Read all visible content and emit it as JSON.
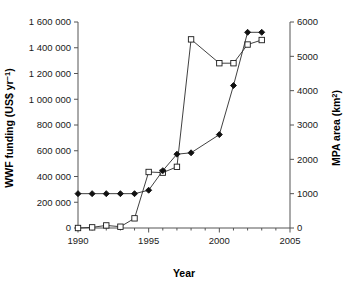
{
  "chart_data": {
    "type": "line",
    "title": "",
    "xlabel": "Year",
    "ylabel": "WWF funding (US$ yr−1)",
    "y2label": "MPA area (km2)",
    "xlim": [
      1990,
      2005
    ],
    "ylim": [
      0,
      1600000
    ],
    "y2lim": [
      0,
      6000
    ],
    "grid": false,
    "legend": "none",
    "x_ticks": [
      "1990",
      "1995",
      "2000",
      "2005"
    ],
    "x_tick_values": [
      1990,
      1995,
      2000,
      2005
    ],
    "x_minor_tick_values": [
      1991,
      1992,
      1993,
      1994,
      1996,
      1997,
      1998,
      1999,
      2001,
      2002,
      2003,
      2004
    ],
    "y_ticks": [
      "0",
      "200 000",
      "400 000",
      "600 000",
      "800 000",
      "1 000 000",
      "1 200 000",
      "1 400 000",
      "1 600 000"
    ],
    "y_tick_values": [
      0,
      200000,
      400000,
      600000,
      800000,
      1000000,
      1200000,
      1400000,
      1600000
    ],
    "y2_ticks": [
      "0",
      "1000",
      "2000",
      "3000",
      "4000",
      "5000",
      "6000"
    ],
    "y2_tick_values": [
      0,
      1000,
      2000,
      3000,
      4000,
      5000,
      6000
    ],
    "series": [
      {
        "name": "WWF funding",
        "axis": "left",
        "marker": "open-square",
        "x": [
          1990,
          1991,
          1992,
          1993,
          1994,
          1995,
          1996,
          1997,
          1998,
          2000,
          2001,
          2002,
          2003
        ],
        "values": [
          0,
          5000,
          20000,
          10000,
          75000,
          435000,
          430000,
          475000,
          1465000,
          1280000,
          1280000,
          1425000,
          1460000
        ]
      },
      {
        "name": "MPA area",
        "axis": "right",
        "marker": "filled-diamond",
        "x": [
          1990,
          1991,
          1992,
          1993,
          1994,
          1995,
          1996,
          1997,
          1998,
          2000,
          2001,
          2002,
          2003
        ],
        "values": [
          1000,
          1000,
          1000,
          1000,
          1000,
          1100,
          1670,
          2150,
          2190,
          2720,
          4150,
          5700,
          5700
        ]
      }
    ]
  }
}
